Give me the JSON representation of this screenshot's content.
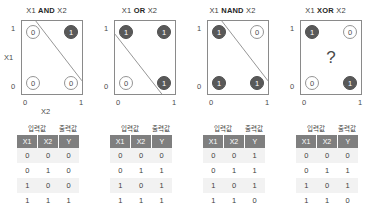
{
  "chart_data": {
    "type": "scatter",
    "xlabel": "X2",
    "ylabel": "X1",
    "xticks": [
      "0",
      "1"
    ],
    "yticks": [
      "0",
      "1"
    ],
    "grid": false,
    "legend": null,
    "table_caption": {
      "input": "입력값",
      "output": "출력값"
    },
    "table_headers": [
      "X1",
      "X2",
      "Y"
    ],
    "colors": {
      "node_one_fill": "#595959",
      "node_one_text": "#ffffff",
      "node_zero_fill": "#ffffff",
      "node_zero_text": "#4a4a4a",
      "box_border": "#8a8a8a",
      "table_header_bg": "#7f7f7f",
      "table_row_alt_bg": "#f2f2f2"
    },
    "panels": [
      {
        "title_prefix": "X1",
        "title_op": "AND",
        "title_suffix": "X2",
        "show_axis_names": true,
        "has_divider": true,
        "divider": {
          "x1": 0.23,
          "y1": 1.0,
          "x2": 1.0,
          "y2": 0.18
        },
        "center_marker": "",
        "points": [
          {
            "corner": "top-left",
            "x": 0,
            "y": 1,
            "value": "0",
            "filled": false
          },
          {
            "corner": "top-right",
            "x": 1,
            "y": 1,
            "value": "1",
            "filled": true
          },
          {
            "corner": "bottom-left",
            "x": 0,
            "y": 0,
            "value": "0",
            "filled": false
          },
          {
            "corner": "bottom-right",
            "x": 1,
            "y": 0,
            "value": "0",
            "filled": false
          }
        ],
        "table_rows": [
          [
            "0",
            "0",
            "0"
          ],
          [
            "0",
            "1",
            "0"
          ],
          [
            "1",
            "0",
            "0"
          ],
          [
            "1",
            "1",
            "1"
          ]
        ]
      },
      {
        "title_prefix": "X1",
        "title_op": "OR",
        "title_suffix": "X2",
        "show_axis_names": false,
        "has_divider": true,
        "divider": {
          "x1": 0.0,
          "y1": 0.82,
          "x2": 0.78,
          "y2": 0.0
        },
        "center_marker": "",
        "points": [
          {
            "corner": "top-left",
            "x": 0,
            "y": 1,
            "value": "1",
            "filled": true
          },
          {
            "corner": "top-right",
            "x": 1,
            "y": 1,
            "value": "1",
            "filled": true
          },
          {
            "corner": "bottom-left",
            "x": 0,
            "y": 0,
            "value": "0",
            "filled": false
          },
          {
            "corner": "bottom-right",
            "x": 1,
            "y": 0,
            "value": "1",
            "filled": true
          }
        ],
        "table_rows": [
          [
            "0",
            "0",
            "0"
          ],
          [
            "0",
            "1",
            "1"
          ],
          [
            "1",
            "0",
            "1"
          ],
          [
            "1",
            "1",
            "1"
          ]
        ]
      },
      {
        "title_prefix": "X1",
        "title_op": "NAND",
        "title_suffix": "X2",
        "show_axis_names": false,
        "has_divider": true,
        "divider": {
          "x1": 0.23,
          "y1": 1.0,
          "x2": 1.0,
          "y2": 0.18
        },
        "center_marker": "",
        "points": [
          {
            "corner": "top-left",
            "x": 0,
            "y": 1,
            "value": "1",
            "filled": true
          },
          {
            "corner": "top-right",
            "x": 1,
            "y": 1,
            "value": "0",
            "filled": false
          },
          {
            "corner": "bottom-left",
            "x": 0,
            "y": 0,
            "value": "1",
            "filled": true
          },
          {
            "corner": "bottom-right",
            "x": 1,
            "y": 0,
            "value": "1",
            "filled": true
          }
        ],
        "table_rows": [
          [
            "0",
            "0",
            "1"
          ],
          [
            "0",
            "1",
            "1"
          ],
          [
            "1",
            "0",
            "1"
          ],
          [
            "1",
            "1",
            "0"
          ]
        ]
      },
      {
        "title_prefix": "X1",
        "title_op": "XOR",
        "title_suffix": "X2",
        "show_axis_names": false,
        "has_divider": false,
        "divider": null,
        "center_marker": "?",
        "points": [
          {
            "corner": "top-left",
            "x": 0,
            "y": 1,
            "value": "1",
            "filled": true
          },
          {
            "corner": "top-right",
            "x": 1,
            "y": 1,
            "value": "0",
            "filled": false
          },
          {
            "corner": "bottom-left",
            "x": 0,
            "y": 0,
            "value": "0",
            "filled": false
          },
          {
            "corner": "bottom-right",
            "x": 1,
            "y": 0,
            "value": "1",
            "filled": true
          }
        ],
        "table_rows": [
          [
            "0",
            "0",
            "0"
          ],
          [
            "0",
            "1",
            "1"
          ],
          [
            "1",
            "0",
            "1"
          ],
          [
            "1",
            "1",
            "0"
          ]
        ]
      }
    ]
  }
}
